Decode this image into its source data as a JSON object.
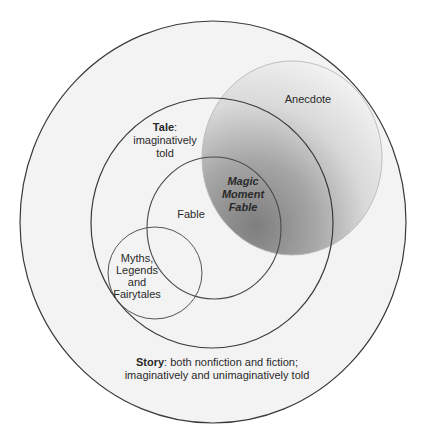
{
  "diagram": {
    "type": "euler-venn",
    "background": "#ffffff",
    "sets": [
      {
        "id": "story",
        "label_bold": "Story",
        "label_rest": ": both nonfiction and fiction;",
        "label_line2": "imaginatively and unimaginatively told",
        "shape": {
          "cx": 213,
          "cy": 222,
          "rx": 193,
          "ry": 201
        },
        "fill": "#f3f3f3",
        "stroke": "#3a3a3a"
      },
      {
        "id": "tale",
        "label_bold": "Tale",
        "label_rest": ":",
        "label_line2": "imaginatively",
        "label_line3": "told",
        "shape": {
          "cx": 212,
          "cy": 223,
          "rx": 121,
          "ry": 125
        },
        "stroke": "#3a3a3a"
      },
      {
        "id": "fable",
        "label": "Fable",
        "shape": {
          "cx": 214,
          "cy": 228,
          "rx": 67,
          "ry": 71
        },
        "stroke": "#4a4a4a"
      },
      {
        "id": "myths",
        "label_lines": [
          "Myths,",
          "Legends",
          "and",
          "Fairytales"
        ],
        "shape": {
          "cx": 155,
          "cy": 273,
          "rx": 47,
          "ry": 46
        },
        "stroke": "#555555"
      },
      {
        "id": "anecdote",
        "label": "Anecdote",
        "shape": {
          "cx": 292,
          "cy": 158,
          "rx": 90,
          "ry": 97
        },
        "gradient": {
          "dark": "#8a8a8a",
          "mid": "#c8c8c8",
          "light": "#f4f4f4"
        },
        "stroke": "#b5b5b5"
      }
    ],
    "intersection_label": {
      "lines": [
        "Magic",
        "Moment",
        "Fable"
      ],
      "between": [
        "anecdote",
        "fable",
        "tale"
      ]
    }
  }
}
